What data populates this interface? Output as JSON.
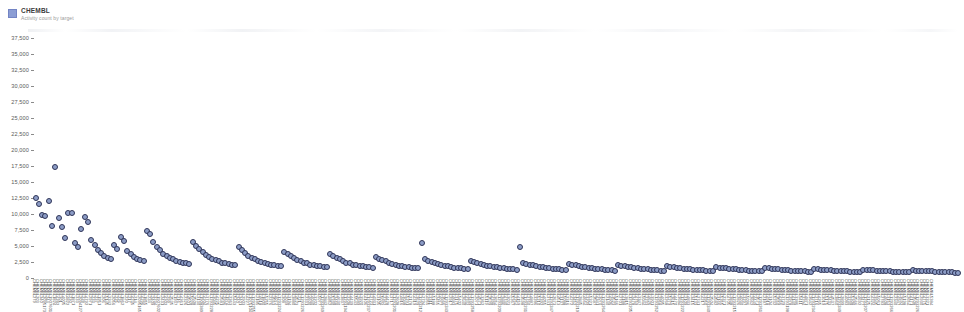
{
  "legend": {
    "series_label": "CHEMBL",
    "subtitle": "Activity count by target",
    "swatch_color": "#8b9dd4"
  },
  "marker": {
    "fill_color": "#8c9cc6",
    "stroke_color": "#2f3558"
  },
  "chart_data": {
    "type": "scatter",
    "title": "CHEMBL",
    "subtitle": "Activity count by target",
    "xlabel": "",
    "ylabel": "",
    "grid": false,
    "legend_position": "top-left",
    "ylim": [
      0,
      37500
    ],
    "ytick_labels": [
      "37,500",
      "35,000",
      "32,500",
      "30,000",
      "27,500",
      "25,000",
      "22,500",
      "20,000",
      "17,500",
      "15,000",
      "12,500",
      "10,000",
      "7,500",
      "5,000",
      "2,500",
      "0"
    ],
    "ytick_values": [
      37500,
      35000,
      32500,
      30000,
      27500,
      25000,
      22500,
      20000,
      17500,
      15000,
      12500,
      10000,
      7500,
      5000,
      2500,
      0
    ],
    "series": [
      {
        "name": "CHEMBL",
        "categories": [
          "CHEMBL279",
          "CHEMBL203",
          "CHEMBL340",
          "CHEMBL2095173",
          "CHEMBL244",
          "CHEMBL1907601",
          "CHEMBL1824",
          "CHEMBL4282",
          "CHEMBL301",
          "CHEMBL4005",
          "CHEMBL4822",
          "CHEMBL230",
          "CHEMBL1871",
          "CHEMBL333",
          "CHEMBL2094127",
          "CHEMBL228",
          "CHEMBL4792",
          "CHEMBL2971",
          "CHEMBL233",
          "CHEMBL237",
          "CHEMBL1951",
          "CHEMBL206",
          "CHEMBL5145",
          "CHEMBL3242",
          "CHEMBL2056",
          "CHEMBL225",
          "CHEMBL226",
          "CHEMBL1862",
          "CHEMBL220",
          "CHEMBL217",
          "CHEMBL4235",
          "CHEMBL214",
          "CHEMBL2095165",
          "CHEMBL4296",
          "CHEMBL1855",
          "CHEMBL224",
          "CHEMBL2409",
          "CHEMBL3234",
          "CHEMBL1907602",
          "CHEMBL2431",
          "CHEMBL4302",
          "CHEMBL299",
          "CHEMBL2535",
          "CHEMBL1937",
          "CHEMBL216",
          "CHEMBL4361",
          "CHEMBL2326",
          "CHEMBL4501",
          "CHEMBL5028",
          "CHEMBL2508",
          "CHEMBL3130",
          "CHEMBL1908389",
          "CHEMBL4204",
          "CHEMBL3776",
          "CHEMBL1293228",
          "CHEMBL3045",
          "CHEMBL4225",
          "CHEMBL2581",
          "CHEMBL2996",
          "CHEMBL1974",
          "CHEMBL2363",
          "CHEMBL5443",
          "CHEMBL240",
          "CHEMBL3401",
          "CHEMBL2903",
          "CHEMBL4227",
          "CHEMBL1075104",
          "CHEMBL1293255",
          "CHEMBL2185",
          "CHEMBL4618",
          "CHEMBL1800",
          "CHEMBL5255",
          "CHEMBL2276",
          "CHEMBL3553",
          "CHEMBL4072",
          "CHEMBL1293224",
          "CHEMBL308",
          "CHEMBL2039",
          "CHEMBL3194",
          "CHEMBL3880",
          "CHEMBL4523",
          "CHEMBL221",
          "CHEMBL1293226",
          "CHEMBL2331",
          "CHEMBL4600",
          "CHEMBL4040",
          "CHEMBL3202",
          "CHEMBL5077",
          "CHEMBL1293269",
          "CHEMBL2842",
          "CHEMBL4852",
          "CHEMBL5330",
          "CHEMBL2468",
          "CHEMBL4630",
          "CHEMBL3837",
          "CHEMBL1293194",
          "CHEMBL2208",
          "CHEMBL4439",
          "CHEMBL5543",
          "CHEMBL2689",
          "CHEMBL3920",
          "CHEMBL4106",
          "CHEMBL1293237",
          "CHEMBL2723",
          "CHEMBL4931",
          "CHEMBL3105",
          "CHEMBL5024",
          "CHEMBL2362",
          "CHEMBL4428",
          "CHEMBL3717",
          "CHEMBL1293201",
          "CHEMBL2608",
          "CHEMBL4816",
          "CHEMBL3048",
          "CHEMBL5291",
          "CHEMBL2178",
          "CHEMBL4319",
          "CHEMBL3629",
          "CHEMBL1293212",
          "CHEMBL2794",
          "CHEMBL4955",
          "CHEMBL3311",
          "CHEMBL5188",
          "CHEMBL2455",
          "CHEMBL4077",
          "CHEMBL3566",
          "CHEMBL1293243",
          "CHEMBL2917",
          "CHEMBL4683",
          "CHEMBL3175",
          "CHEMBL5402",
          "CHEMBL2640",
          "CHEMBL4244",
          "CHEMBL3489",
          "CHEMBL1293258",
          "CHEMBL2071",
          "CHEMBL4571",
          "CHEMBL3362",
          "CHEMBL5119",
          "CHEMBL2529",
          "CHEMBL4398",
          "CHEMBL3654",
          "CHEMBL1293209",
          "CHEMBL2886",
          "CHEMBL4740",
          "CHEMBL3023",
          "CHEMBL5367",
          "CHEMBL2254",
          "CHEMBL4159",
          "CHEMBL3598",
          "CHEMBL1293231",
          "CHEMBL2760",
          "CHEMBL4887",
          "CHEMBL3286",
          "CHEMBL5210",
          "CHEMBL2392",
          "CHEMBL4055",
          "CHEMBL3741",
          "CHEMBL1293247",
          "CHEMBL2673",
          "CHEMBL4513",
          "CHEMBL3137",
          "CHEMBL5088",
          "CHEMBL2316",
          "CHEMBL4272",
          "CHEMBL3452",
          "CHEMBL1293219",
          "CHEMBL2845",
          "CHEMBL4664",
          "CHEMBL3209",
          "CHEMBL5321",
          "CHEMBL2587",
          "CHEMBL4341",
          "CHEMBL3070",
          "CHEMBL1293264",
          "CHEMBL2140",
          "CHEMBL4906",
          "CHEMBL3523",
          "CHEMBL5166",
          "CHEMBL2701",
          "CHEMBL4188",
          "CHEMBL3815",
          "CHEMBL1293205",
          "CHEMBL2478",
          "CHEMBL4759",
          "CHEMBL3347",
          "CHEMBL5044",
          "CHEMBL2233",
          "CHEMBL4626",
          "CHEMBL3901",
          "CHEMBL1293252",
          "CHEMBL2958",
          "CHEMBL4095",
          "CHEMBL3268",
          "CHEMBL5279",
          "CHEMBL2615",
          "CHEMBL4470",
          "CHEMBL3684",
          "CHEMBL1293222",
          "CHEMBL2109",
          "CHEMBL4833",
          "CHEMBL3415",
          "CHEMBL5133",
          "CHEMBL2741",
          "CHEMBL4217",
          "CHEMBL3950",
          "CHEMBL1293240",
          "CHEMBL2504",
          "CHEMBL4582",
          "CHEMBL3166",
          "CHEMBL5355",
          "CHEMBL2371",
          "CHEMBL4705",
          "CHEMBL3838",
          "CHEMBL1293215",
          "CHEMBL2826",
          "CHEMBL4030",
          "CHEMBL3297",
          "CHEMBL5096",
          "CHEMBL2662",
          "CHEMBL4449",
          "CHEMBL3571",
          "CHEMBL1293261",
          "CHEMBL2187",
          "CHEMBL4918",
          "CHEMBL3104",
          "CHEMBL5232",
          "CHEMBL2550",
          "CHEMBL4356",
          "CHEMBL3729",
          "CHEMBL1293198",
          "CHEMBL2978",
          "CHEMBL4140",
          "CHEMBL3386",
          "CHEMBL5411",
          "CHEMBL2294",
          "CHEMBL4871",
          "CHEMBL3642",
          "CHEMBL1293234",
          "CHEMBL2716",
          "CHEMBL4265",
          "CHEMBL3019",
          "CHEMBL5175",
          "CHEMBL2433",
          "CHEMBL4537",
          "CHEMBL3860",
          "CHEMBL1293249",
          "CHEMBL2899",
          "CHEMBL4083",
          "CHEMBL3230",
          "CHEMBL5308",
          "CHEMBL2566",
          "CHEMBL4692",
          "CHEMBL3477",
          "CHEMBL1293207",
          "CHEMBL2125",
          "CHEMBL4324",
          "CHEMBL3945",
          "CHEMBL5061",
          "CHEMBL2783",
          "CHEMBL4608",
          "CHEMBL3153",
          "CHEMBL1293266",
          "CHEMBL2340",
          "CHEMBL4947",
          "CHEMBL3692",
          "CHEMBL5198",
          "CHEMBL2654",
          "CHEMBL4171",
          "CHEMBL3508",
          "CHEMBL1293226",
          "CHEMBL2930",
          "CHEMBL4775",
          "CHEMBL3321",
          "CHEMBL5384"
        ],
        "values": [
          12500,
          11600,
          9800,
          9700,
          12000,
          8100,
          17300,
          9400,
          7900,
          6200,
          10200,
          10100,
          5400,
          4800,
          7600,
          9600,
          8700,
          6000,
          5200,
          4400,
          3900,
          3500,
          3100,
          2900,
          5100,
          4600,
          6400,
          5800,
          4200,
          3700,
          3300,
          3000,
          2800,
          2600,
          7400,
          6800,
          5600,
          4900,
          4300,
          3800,
          3400,
          3100,
          2900,
          2700,
          2500,
          2400,
          2300,
          2200,
          5700,
          5000,
          4500,
          4000,
          3600,
          3300,
          3000,
          2800,
          2600,
          2400,
          2300,
          2200,
          2100,
          2000,
          4800,
          4300,
          3900,
          3500,
          3200,
          2900,
          2700,
          2500,
          2400,
          2200,
          2100,
          2000,
          1900,
          1850,
          4100,
          3700,
          3400,
          3100,
          2800,
          2600,
          2400,
          2300,
          2100,
          2000,
          1900,
          1800,
          1750,
          1700,
          3800,
          3400,
          3100,
          2900,
          2600,
          2400,
          2300,
          2100,
          2000,
          1900,
          1800,
          1700,
          1650,
          1600,
          3300,
          3000,
          2800,
          2600,
          2400,
          2200,
          2100,
          1950,
          1850,
          1750,
          1650,
          1600,
          1550,
          1500,
          5500,
          2900,
          2700,
          2500,
          2300,
          2150,
          2000,
          1900,
          1800,
          1700,
          1600,
          1550,
          1500,
          1450,
          1400,
          2700,
          2500,
          2350,
          2200,
          2050,
          1950,
          1850,
          1750,
          1650,
          1550,
          1500,
          1450,
          1400,
          1350,
          1300,
          4900,
          2400,
          2250,
          2100,
          1980,
          1880,
          1780,
          1680,
          1600,
          1520,
          1450,
          1400,
          1350,
          1300,
          1260,
          2200,
          2080,
          1960,
          1860,
          1760,
          1680,
          1600,
          1520,
          1450,
          1390,
          1340,
          1290,
          1250,
          1210,
          1170,
          2000,
          1900,
          1810,
          1730,
          1650,
          1580,
          1510,
          1450,
          1390,
          1340,
          1290,
          1250,
          1210,
          1170,
          1140,
          1850,
          1760,
          1680,
          1610,
          1540,
          1480,
          1420,
          1370,
          1320,
          1270,
          1230,
          1190,
          1150,
          1120,
          1090,
          1700,
          1630,
          1560,
          1500,
          1440,
          1390,
          1340,
          1290,
          1250,
          1210,
          1170,
          1140,
          1100,
          1070,
          1040,
          1560,
          1500,
          1440,
          1390,
          1340,
          1290,
          1250,
          1210,
          1170,
          1130,
          1100,
          1070,
          1040,
          1010,
          980,
          1430,
          1380,
          1330,
          1290,
          1240,
          1200,
          1160,
          1130,
          1090,
          1060,
          1030,
          1000,
          975,
          950,
          925,
          1310,
          1270,
          1230,
          1190,
          1160,
          1120,
          1090,
          1060,
          1030,
          1000,
          975,
          950,
          925,
          900,
          880,
          1200,
          1170,
          1140,
          1110,
          1080,
          1050,
          1020,
          995,
          970,
          945,
          920,
          900,
          880,
          860,
          840
        ]
      }
    ]
  }
}
